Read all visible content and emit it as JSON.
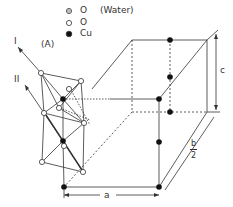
{
  "legend": {
    "items": [
      {
        "symbol": "double-open-circle",
        "label": "O",
        "note": "(Water)"
      },
      {
        "symbol": "open-circle",
        "label": "O"
      },
      {
        "symbol": "filled-circle",
        "label": "Cu"
      }
    ]
  },
  "labels": {
    "axis_I": "I",
    "axis_II": "II",
    "group_A": "(A)",
    "dim_a": "a",
    "dim_c": "c",
    "dim_b_num": "b",
    "dim_b_den": "2"
  },
  "colors": {
    "line": "#333333",
    "fill_cu": "#111111",
    "fill_o": "#ffffff"
  }
}
